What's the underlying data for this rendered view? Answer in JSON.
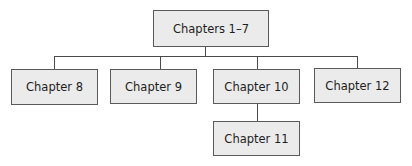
{
  "diagram": {
    "type": "hierarchy",
    "root": {
      "label": "Chapters 1–7"
    },
    "level1": [
      {
        "label": "Chapter 8"
      },
      {
        "label": "Chapter 9"
      },
      {
        "label": "Chapter 10"
      },
      {
        "label": "Chapter 12"
      }
    ],
    "level2": [
      {
        "label": "Chapter 11",
        "parent": "Chapter 10"
      }
    ],
    "colors": {
      "node_fill": "#ebebeb",
      "node_border": "#5a5a5a",
      "connector": "#4a4a4a"
    }
  }
}
